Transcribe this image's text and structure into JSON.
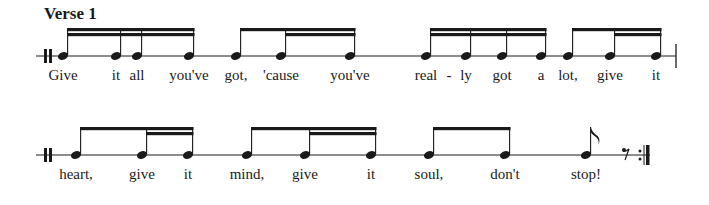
{
  "title": "Verse 1",
  "colors": {
    "ink": "#1a1a1a",
    "background": "#ffffff"
  },
  "systems": [
    {
      "staff_y": 56,
      "staff_x": [
        36,
        676
      ],
      "start_barline": "double-thick",
      "end_barline": "single",
      "notes": [
        {
          "x": 63,
          "type": "sixteenth",
          "lyric": "Give"
        },
        {
          "x": 116,
          "type": "sixteenth",
          "lyric": "it"
        },
        {
          "x": 137,
          "type": "sixteenth",
          "lyric": "all"
        },
        {
          "x": 189,
          "type": "sixteenth",
          "lyric": "you've"
        },
        {
          "x": 236,
          "type": "eighth",
          "lyric": "got,"
        },
        {
          "x": 281,
          "type": "sixteenth",
          "lyric": "'cause"
        },
        {
          "x": 350,
          "type": "sixteenth",
          "lyric": "you've"
        },
        {
          "x": 426,
          "type": "sixteenth",
          "lyric": "real"
        },
        {
          "x": 466,
          "type": "sixteenth",
          "lyric": "ly"
        },
        {
          "x": 502,
          "type": "sixteenth",
          "lyric": "got"
        },
        {
          "x": 541,
          "type": "sixteenth",
          "lyric": "a"
        },
        {
          "x": 568,
          "type": "eighth",
          "lyric": "lot,"
        },
        {
          "x": 610,
          "type": "sixteenth",
          "lyric": "give"
        },
        {
          "x": 656,
          "type": "sixteenth",
          "lyric": "it"
        }
      ],
      "hyphens": [
        {
          "x": 449,
          "text": "-"
        }
      ],
      "beams": [
        {
          "from": 63,
          "to": 189,
          "levels": [
            [
              63,
              189
            ],
            [
              63,
              189
            ]
          ]
        },
        {
          "from": 236,
          "to": 350,
          "levels": [
            [
              236,
              350
            ],
            [
              281,
              350
            ]
          ]
        },
        {
          "from": 426,
          "to": 541,
          "levels": [
            [
              426,
              541
            ],
            [
              426,
              541
            ]
          ]
        },
        {
          "from": 568,
          "to": 656,
          "levels": [
            [
              568,
              656
            ],
            [
              610,
              656
            ]
          ]
        }
      ]
    },
    {
      "staff_y": 155,
      "staff_x": [
        36,
        650
      ],
      "start_barline": "double-thick",
      "end_barline": "end-repeat",
      "notes": [
        {
          "x": 76,
          "type": "eighth",
          "lyric": "heart,"
        },
        {
          "x": 142,
          "type": "sixteenth",
          "lyric": "give"
        },
        {
          "x": 188,
          "type": "sixteenth",
          "lyric": "it"
        },
        {
          "x": 247,
          "type": "eighth",
          "lyric": "mind,"
        },
        {
          "x": 305,
          "type": "sixteenth",
          "lyric": "give"
        },
        {
          "x": 371,
          "type": "sixteenth",
          "lyric": "it"
        },
        {
          "x": 429,
          "type": "eighth",
          "lyric": "soul,"
        },
        {
          "x": 505,
          "type": "eighth",
          "lyric": "don't"
        },
        {
          "x": 586,
          "type": "eighth-flag",
          "lyric": "stop!"
        }
      ],
      "hyphens": [],
      "rests": [
        {
          "x": 626,
          "type": "eighth-rest"
        }
      ],
      "beams": [
        {
          "from": 76,
          "to": 188,
          "levels": [
            [
              76,
              188
            ],
            [
              142,
              188
            ]
          ]
        },
        {
          "from": 247,
          "to": 371,
          "levels": [
            [
              247,
              371
            ],
            [
              305,
              371
            ]
          ]
        },
        {
          "from": 429,
          "to": 505,
          "levels": [
            [
              429,
              505
            ]
          ]
        }
      ]
    }
  ]
}
